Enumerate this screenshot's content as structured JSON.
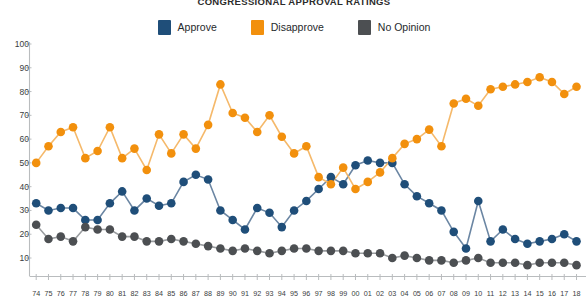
{
  "chart_data": {
    "type": "line",
    "title": "CONGRESSIONAL APPROVAL RATINGS",
    "xlabel": "",
    "ylabel": "",
    "ylim": [
      0,
      100
    ],
    "yticks": [
      10,
      20,
      30,
      40,
      50,
      60,
      70,
      80,
      90,
      100
    ],
    "grid": false,
    "legend_position": "top-center",
    "markers": true,
    "categories": [
      "74",
      "75",
      "76",
      "77",
      "78",
      "79",
      "80",
      "81",
      "82",
      "83",
      "84",
      "85",
      "86",
      "87",
      "88",
      "89",
      "90",
      "91",
      "92",
      "93",
      "94",
      "95",
      "96",
      "97",
      "98",
      "99",
      "00",
      "01",
      "02",
      "03",
      "04",
      "05",
      "06",
      "07",
      "08",
      "09",
      "10",
      "11",
      "12",
      "13",
      "14",
      "15",
      "16",
      "17",
      "18"
    ],
    "series": [
      {
        "name": "Approve",
        "color": "#1F4E79",
        "values": [
          33,
          30,
          31,
          31,
          26,
          26,
          33,
          38,
          30,
          35,
          32,
          33,
          42,
          45,
          43,
          30,
          26,
          22,
          31,
          29,
          23,
          30,
          34,
          39,
          44,
          41,
          49,
          51,
          50,
          50,
          41,
          36,
          33,
          30,
          21,
          14,
          34,
          17,
          22,
          18,
          16,
          17,
          18,
          20,
          17
        ]
      },
      {
        "name": "Disapprove",
        "color": "#F2900D",
        "values": [
          50,
          57,
          63,
          65,
          52,
          55,
          65,
          52,
          56,
          47,
          62,
          54,
          62,
          56,
          66,
          83,
          71,
          69,
          63,
          70,
          61,
          54,
          57,
          44,
          41,
          48,
          39,
          42,
          46,
          52,
          58,
          60,
          64,
          57,
          75,
          77,
          74,
          81,
          82,
          83,
          84,
          86,
          84,
          79,
          82
        ]
      },
      {
        "name": "No Opinion",
        "color": "#4C4F52"
      }
    ],
    "series3_values": [
      24,
      18,
      19,
      17,
      23,
      22,
      22,
      19,
      19,
      17,
      17,
      18,
      17,
      16,
      15,
      14,
      13,
      14,
      13,
      12,
      13,
      14,
      14,
      13,
      13,
      13,
      12,
      12,
      12,
      10,
      11,
      10,
      9,
      9,
      8,
      9,
      10,
      8,
      8,
      8,
      7,
      8,
      8,
      8,
      7
    ]
  },
  "legend": {
    "items": [
      {
        "label": "Approve",
        "color": "#1F4E79",
        "icon": "square-swatch"
      },
      {
        "label": "Disapprove",
        "color": "#F2900D",
        "icon": "square-swatch"
      },
      {
        "label": "No Opinion",
        "color": "#4C4F52",
        "icon": "square-swatch"
      }
    ]
  }
}
